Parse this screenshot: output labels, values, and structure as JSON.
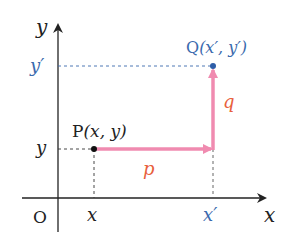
{
  "diagram": {
    "axes": {
      "x_label": "x",
      "y_label": "y",
      "origin_label": "O"
    },
    "ticks": {
      "x_tick": "x",
      "x_prime_tick": "x′",
      "y_tick": "y",
      "y_prime_tick": "y′"
    },
    "points": {
      "P": {
        "name": "P",
        "coords": "(x, y)"
      },
      "Q": {
        "name": "Q",
        "coords": "(x′, y′)"
      }
    },
    "vectors": {
      "p": "p",
      "q": "q"
    },
    "colors": {
      "axis": "#222222",
      "prime_blue": "#3a6aad",
      "vector_pink": "#f08bb0",
      "label_orange": "#e8603c",
      "dashed": "#555555"
    }
  }
}
